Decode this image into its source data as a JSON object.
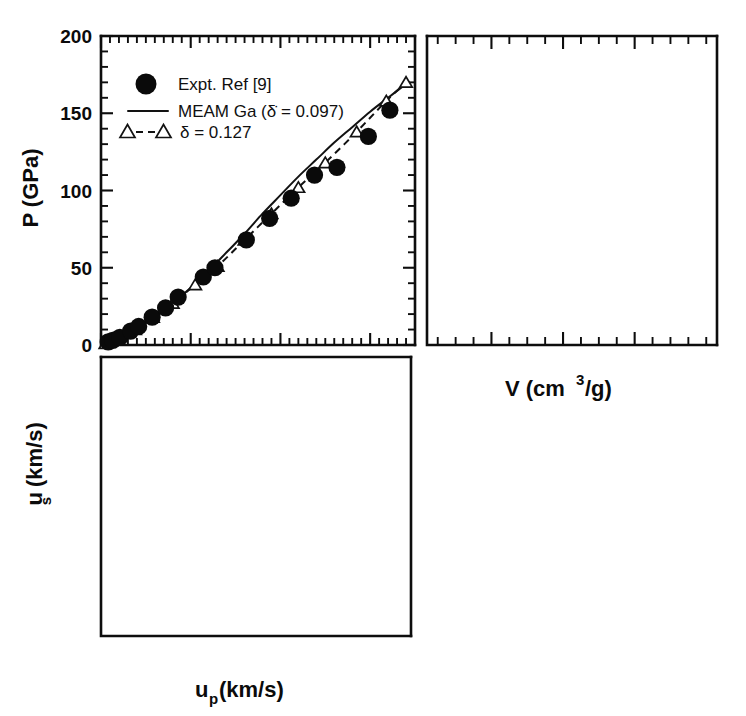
{
  "figure": {
    "background_color": "#ffffff",
    "ink_color": "#0d0d0d",
    "panel_count": 3
  },
  "legend": {
    "items": [
      {
        "marker": "filled-circle",
        "label": "Expt. Ref [9]"
      },
      {
        "marker": "solid-line",
        "label": "MEAM Ga (δ̇ = 0.097)"
      },
      {
        "marker": "dashed-triangle-line",
        "label": "δ = 0.127"
      }
    ]
  },
  "axes_labels": {
    "p_axis": "P (GPa)",
    "v_axis_main": "V  (cm",
    "v_axis_sup": "3",
    "v_axis_tail": "/g)",
    "us_axis_main": "u",
    "us_axis_sub": "s",
    "us_axis_tail": " (km/s)",
    "up_axis_main": "u",
    "up_axis_sub": "p",
    "up_axis_tail": " (km/s)"
  },
  "chart_data": [
    {
      "id": "panel-p-vs-up",
      "type": "scatter",
      "title": "",
      "xlabel": "u_p (km/s)",
      "ylabel": "P (GPa)",
      "xlim": [
        0,
        3.5
      ],
      "ylim": [
        0,
        200
      ],
      "xticks": [
        0,
        1,
        2,
        3
      ],
      "xticklabels": [
        "",
        "",
        "",
        ""
      ],
      "yticks": [
        0,
        50,
        100,
        150,
        200
      ],
      "yticklabels": [
        "0",
        "50",
        "100",
        "150",
        "200"
      ],
      "xminor_step": 0.1,
      "yminor_step": 10,
      "grid": false,
      "legend_position": "upper-left",
      "series": [
        {
          "name": "Expt. Ref [9]",
          "marker": "filled-circle",
          "x": [
            0.08,
            0.13,
            0.21,
            0.33,
            0.42,
            0.57,
            0.72,
            0.86,
            1.14,
            1.27,
            1.62,
            1.88,
            2.12,
            2.38,
            2.63,
            2.98,
            3.22
          ],
          "y": [
            2,
            3,
            5,
            9,
            12,
            18,
            24,
            31,
            44,
            50,
            68,
            82,
            95,
            110,
            115,
            135,
            152
          ]
        },
        {
          "name": "MEAM Ga (delta-dot = 0.097)",
          "marker": "solid-line",
          "x": [
            0.0,
            0.2,
            0.4,
            0.6,
            0.8,
            1.0,
            1.2,
            1.4,
            1.6,
            1.8,
            2.0,
            2.2,
            2.4,
            2.6,
            2.8,
            3.0,
            3.2,
            3.4
          ],
          "y": [
            0,
            5,
            11,
            18,
            27,
            37,
            48,
            60,
            72,
            85,
            97,
            109,
            120,
            131,
            141,
            151,
            160,
            169
          ]
        },
        {
          "name": "delta = 0.127",
          "marker": "dashed-triangle",
          "x": [
            0.05,
            0.2,
            0.38,
            0.58,
            0.8,
            1.05,
            1.3,
            1.6,
            1.9,
            2.2,
            2.5,
            2.85,
            3.18,
            3.4
          ],
          "y": [
            1,
            5,
            10,
            18,
            27,
            39,
            51,
            68,
            85,
            102,
            118,
            138,
            158,
            170
          ]
        }
      ]
    },
    {
      "id": "panel-p-vs-v",
      "type": "scatter",
      "title": "",
      "xlabel": "V (cm3/g)",
      "ylabel": "P (GPa)",
      "xlim": [
        0.082,
        0.163
      ],
      "ylim": [
        0,
        200
      ],
      "xticks": [
        0.1,
        0.12,
        0.14
      ],
      "xticklabels": [
        "0.1",
        "0.12",
        "0.14"
      ],
      "xminor_step": 0.005,
      "yminor_step": 10,
      "grid": false,
      "series": [
        {
          "name": "Expt. Ref [9]",
          "marker": "filled-circle",
          "x": [
            0.0955,
            0.1008,
            0.105,
            0.1068,
            0.1135,
            0.1195,
            0.124,
            0.1255,
            0.13,
            0.133,
            0.1375,
            0.141,
            0.145,
            0.1485,
            0.161
          ],
          "y": [
            152,
            135,
            115,
            110,
            95,
            82,
            68,
            62,
            50,
            44,
            31,
            24,
            18,
            12,
            2
          ]
        },
        {
          "name": "MEAM Ga (delta-dot = 0.097)",
          "marker": "solid-line",
          "x": [
            0.09,
            0.093,
            0.097,
            0.101,
            0.106,
            0.112,
            0.119,
            0.126,
            0.133,
            0.141,
            0.149,
            0.156,
            0.161
          ],
          "y": [
            200,
            183,
            158,
            134,
            110,
            87,
            66,
            49,
            35,
            23,
            13,
            6,
            2
          ]
        },
        {
          "name": "delta = 0.127",
          "marker": "dashed-triangle",
          "x": [
            0.0912,
            0.0955,
            0.101,
            0.1075,
            0.115,
            0.122,
            0.13,
            0.1375,
            0.145,
            0.152,
            0.158,
            0.161
          ],
          "y": [
            200,
            170,
            136,
            105,
            78,
            57,
            39,
            26,
            16,
            9,
            4,
            2
          ]
        }
      ]
    },
    {
      "id": "panel-us-vs-up",
      "type": "scatter",
      "title": "",
      "xlabel": "u_p (km/s)",
      "ylabel": "u_s (km/s)",
      "xlim": [
        0,
        3.5
      ],
      "ylim": [
        2,
        8
      ],
      "xticks": [
        0,
        1,
        2,
        3
      ],
      "xticklabels": [
        "0",
        "1",
        "2",
        "3"
      ],
      "yticks": [
        2,
        3,
        4,
        5,
        6,
        7,
        8
      ],
      "yticklabels": [
        "2",
        "3",
        "4",
        "5",
        "6",
        "7",
        ""
      ],
      "xminor_step": 0.1,
      "yminor_step": 0.2,
      "grid": false,
      "series": [
        {
          "name": "Expt. Ref [9]",
          "marker": "filled-circle",
          "x": [
            0.33,
            0.38,
            0.57,
            0.72,
            1.13,
            1.25,
            2.1,
            2.25,
            2.38,
            2.68,
            3.22
          ],
          "y": [
            3.42,
            3.48,
            3.72,
            3.88,
            4.62,
            4.78,
            6.05,
            6.22,
            6.42,
            6.92,
            7.78
          ]
        },
        {
          "name": "MEAM Ga (delta-dot = 0.097)",
          "marker": "solid-line",
          "x": [
            0.0,
            0.2,
            0.4,
            0.6,
            0.8,
            1.0,
            1.3,
            1.6,
            1.9,
            2.2,
            2.5,
            2.8,
            3.1,
            3.4
          ],
          "y": [
            2.62,
            2.67,
            2.86,
            3.1,
            3.38,
            3.66,
            4.08,
            4.5,
            4.94,
            5.38,
            5.82,
            6.26,
            6.7,
            7.14
          ]
        },
        {
          "name": "delta = 0.127",
          "marker": "dashed-triangle",
          "x": [
            0.06,
            0.15,
            0.25,
            0.38,
            0.52,
            0.7,
            0.92,
            1.2,
            1.55,
            1.9,
            2.25,
            2.62,
            3.0,
            3.35
          ],
          "y": [
            2.8,
            2.82,
            2.86,
            3.0,
            3.18,
            3.42,
            3.7,
            4.08,
            4.55,
            5.05,
            5.55,
            6.05,
            6.58,
            7.1
          ]
        }
      ]
    }
  ]
}
